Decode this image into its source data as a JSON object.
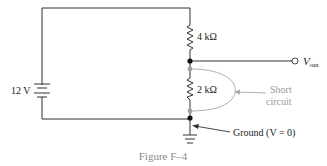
{
  "figure": {
    "caption": "Figure F–4",
    "caption_color": "#8a8a8a"
  },
  "source": {
    "label": "12 V",
    "type": "battery"
  },
  "resistors": [
    {
      "label": "4 kΩ",
      "position": "top"
    },
    {
      "label": "2 kΩ",
      "position": "bottom"
    }
  ],
  "output": {
    "label_main": "V",
    "label_sub": "out"
  },
  "annotations": {
    "short_circuit_line1": "Short",
    "short_circuit_line2": "circuit",
    "ground": "Ground (V = 0)"
  },
  "colors": {
    "wire": "#333333",
    "short_path": "#a8a8a8",
    "node_black": "#111111",
    "node_gray": "#a0a0a0"
  }
}
